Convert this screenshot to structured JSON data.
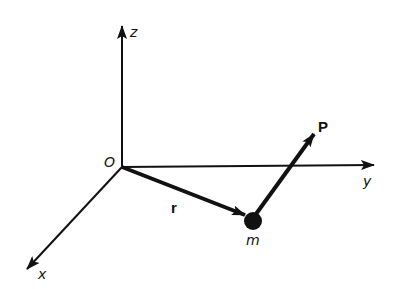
{
  "diagram": {
    "type": "3d-coordinate-system-vector",
    "origin_label": "O",
    "axes": [
      {
        "name": "z",
        "label": "z"
      },
      {
        "name": "y",
        "label": "y"
      },
      {
        "name": "x",
        "label": "x"
      }
    ],
    "vectors": [
      {
        "name": "position",
        "label": "r",
        "from": "O",
        "to": "m"
      },
      {
        "name": "momentum",
        "label": "P",
        "from": "m"
      }
    ],
    "particle": {
      "label": "m"
    },
    "colors": {
      "ink": "#111111",
      "background": "#ffffff"
    }
  }
}
